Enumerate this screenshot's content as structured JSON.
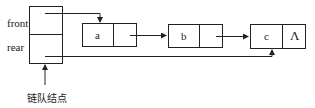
{
  "diagram": {
    "type": "linked-queue",
    "header": {
      "fields": [
        "front",
        "rear"
      ],
      "caption": "链队结点"
    },
    "nodes": [
      {
        "data": "a",
        "next": "b"
      },
      {
        "data": "b",
        "next": "c"
      },
      {
        "data": "c",
        "next": "Λ"
      }
    ],
    "null_symbol": "Λ"
  }
}
